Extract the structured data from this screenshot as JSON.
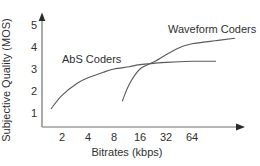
{
  "figure": {
    "background": "#ffffff",
    "curve_color": "#5a5a5a",
    "axis_color": "#707070",
    "text_color": "#2f2f2f"
  },
  "chart_data": {
    "type": "line",
    "title": "",
    "xlabel": "Bitrates (kbps)",
    "ylabel": "Subjective Quality (MOS)",
    "x_scale": "log2",
    "x_ticks": [
      2,
      4,
      8,
      16,
      32,
      64
    ],
    "y_ticks": [
      1,
      2,
      3,
      4,
      5
    ],
    "xlim": [
      1.3,
      210
    ],
    "ylim": [
      0.4,
      5.5
    ],
    "grid": false,
    "legend": "inline-labels",
    "series": [
      {
        "name": "AbS Coders",
        "x": [
          1.5,
          2,
          3,
          4,
          6,
          8,
          12,
          16,
          32,
          64,
          120
        ],
        "y": [
          1.2,
          1.8,
          2.35,
          2.6,
          2.85,
          3.0,
          3.1,
          3.2,
          3.3,
          3.35,
          3.35
        ]
      },
      {
        "name": "Waveform Coders",
        "x": [
          10,
          12,
          16,
          24,
          32,
          48,
          64,
          128,
          200
        ],
        "y": [
          1.55,
          2.3,
          3.0,
          3.35,
          3.65,
          4.0,
          4.15,
          4.3,
          4.4
        ]
      }
    ]
  }
}
